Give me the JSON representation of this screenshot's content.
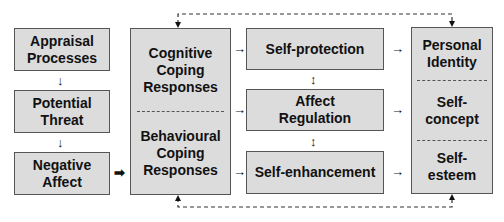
{
  "diagram": {
    "left_column": [
      {
        "id": "appraisal",
        "lines": [
          "Appraisal",
          "Processes"
        ]
      },
      {
        "id": "threat",
        "lines": [
          "Potential",
          "Threat"
        ]
      },
      {
        "id": "affect",
        "lines": [
          "Negative",
          "Affect"
        ]
      }
    ],
    "coping_box": {
      "sections": [
        {
          "id": "cognitive",
          "lines": [
            "Cognitive",
            "Coping",
            "Responses"
          ]
        },
        {
          "id": "behavioural",
          "lines": [
            "Behavioural",
            "Coping",
            "Responses"
          ]
        }
      ]
    },
    "middle_column": [
      {
        "id": "self-protection",
        "lines": [
          "Self-protection"
        ]
      },
      {
        "id": "affect-regulation",
        "lines": [
          "Affect",
          "Regulation"
        ]
      },
      {
        "id": "self-enhancement",
        "lines": [
          "Self-enhancement"
        ]
      }
    ],
    "identity_box": {
      "sections": [
        {
          "id": "personal-identity",
          "lines": [
            "Personal",
            "Identity"
          ]
        },
        {
          "id": "self-concept",
          "lines": [
            "Self-",
            "concept"
          ]
        },
        {
          "id": "self-esteem",
          "lines": [
            "Self-",
            "esteem"
          ]
        }
      ]
    },
    "colors": {
      "box_fill": "#dcdcdc",
      "box_border": "#555555",
      "text": "#111111",
      "arrow": "#111111"
    }
  }
}
